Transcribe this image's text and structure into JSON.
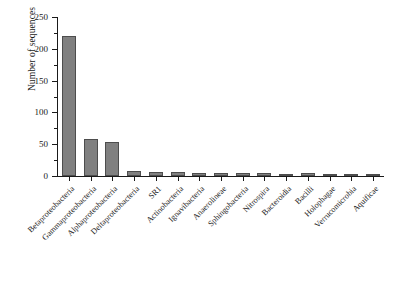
{
  "chart_data": {
    "type": "bar",
    "title": "",
    "subtitle": "",
    "xlabel": "",
    "ylabel": "Number of sequences",
    "ylim": [
      0,
      250
    ],
    "y_ticks": [
      0,
      50,
      100,
      150,
      200,
      250
    ],
    "y_minor_ticks": [
      25,
      75,
      125,
      175,
      225
    ],
    "grid": false,
    "legend": null,
    "bar_color": "#808080",
    "bar_edge_color": "#4d4d4d",
    "axis_color": "#1a1a1a",
    "background_color": "#ffffff",
    "categories": [
      "Betaproteobacteria",
      "Gammaproteobacteria",
      "Alphaproteobacteria",
      "Deltaproteobacteria",
      "SR1",
      "Actinobacteria",
      "Ignavibacteria",
      "Anaerolineae",
      "Sphingobacteria",
      "Nitrospira",
      "Bacteroidia",
      "Bacilli",
      "Holophagae",
      "Verrucomicrobia",
      "Aquificae"
    ],
    "values": [
      220,
      58,
      54,
      8,
      6,
      6,
      4,
      4,
      4,
      4,
      3,
      4,
      3,
      2,
      2
    ]
  }
}
